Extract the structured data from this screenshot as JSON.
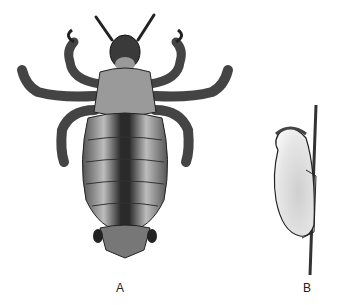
{
  "figure": {
    "panels": [
      {
        "id": "A",
        "label": "A",
        "subject": "head louse, dorsal view"
      },
      {
        "id": "B",
        "label": "B",
        "subject": "nit (egg) cemented to hair shaft"
      }
    ]
  },
  "colors": {
    "background": "#ffffff",
    "ink": "#1a1a1a",
    "body_mid": "#8a8a8a",
    "body_dark": "#2a2a2a",
    "egg_fill": "#d8d8d8"
  }
}
